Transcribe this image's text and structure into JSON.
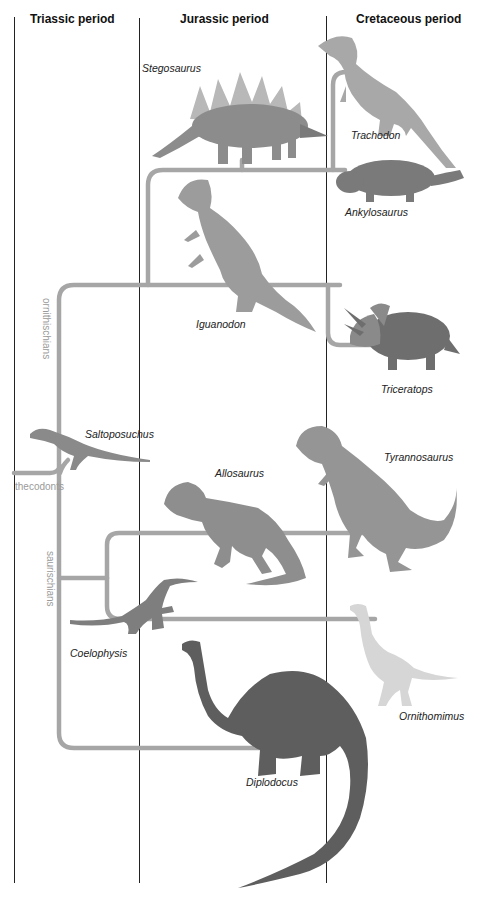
{
  "periods": [
    {
      "label": "Triassic period"
    },
    {
      "label": "Jurassic period"
    },
    {
      "label": "Cretaceous period"
    }
  ],
  "groups": {
    "ornithischians": "ornithischians",
    "thecodonts": "thecodonts",
    "saurischians": "saurischians"
  },
  "dinosaurs": [
    {
      "name": "Stegosaurus"
    },
    {
      "name": "Trachodon"
    },
    {
      "name": "Ankylosaurus"
    },
    {
      "name": "Iguanodon"
    },
    {
      "name": "Triceratops"
    },
    {
      "name": "Saltoposuchus"
    },
    {
      "name": "Allosaurus"
    },
    {
      "name": "Tyrannosaurus"
    },
    {
      "name": "Coelophysis"
    },
    {
      "name": "Ornithomimus"
    },
    {
      "name": "Diplodocus"
    }
  ],
  "colors": {
    "branch": "#a6a6a6",
    "divider": "#222222",
    "group_text": "#9a9a9a"
  }
}
